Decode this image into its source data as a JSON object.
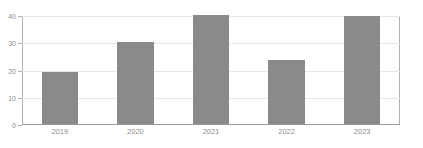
{
  "watermark": {
    "text": " "
  },
  "chart_data": {
    "type": "bar",
    "title": "",
    "subtitle": "",
    "xlabel": "",
    "ylabel": "",
    "categories": [
      "2019",
      "2020",
      "2021",
      "2022",
      "2023"
    ],
    "values": [
      19,
      30,
      40,
      23.5,
      39.7
    ],
    "series": [
      {
        "name": "",
        "values": [
          19,
          30,
          40,
          23.5,
          39.7
        ]
      }
    ],
    "ylim": [
      0,
      40
    ],
    "ytick_labels": [
      "0",
      "10",
      "20",
      "30",
      "40"
    ],
    "ytick_values": [
      0,
      10,
      20,
      30,
      40
    ],
    "grid": true,
    "grid_axis": "y",
    "legend": false,
    "legend_position": "none",
    "bar_color": "#8a8a8a",
    "grid_color": "#e6e6e6",
    "axis_color": "#b0b0b0",
    "tick_label_color": "#8c8c8c",
    "background_color": "#ffffff",
    "annotations": []
  }
}
